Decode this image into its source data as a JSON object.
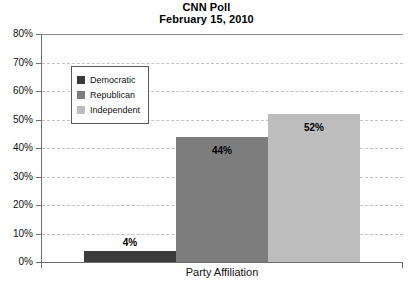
{
  "chart_data": {
    "type": "bar",
    "title": "CNN Poll",
    "subtitle": "February 15, 2010",
    "xlabel": "Party Affiliation",
    "ylabel": "",
    "categories": [
      "Democratic",
      "Republican",
      "Independent"
    ],
    "values": [
      4,
      44,
      52
    ],
    "value_labels": [
      "4%",
      "44%",
      "52%"
    ],
    "ylim": [
      0,
      80
    ],
    "y_ticks": [
      0,
      10,
      20,
      30,
      40,
      50,
      60,
      70,
      80
    ],
    "y_tick_labels": [
      "0%",
      "10%",
      "20%",
      "30%",
      "40%",
      "50%",
      "60%",
      "70%",
      "80%"
    ],
    "grid": true,
    "legend_position": "upper-left-inside",
    "series_colors": [
      "#3b3b3b",
      "#7d7d7d",
      "#bdbdbd"
    ]
  },
  "legend": {
    "items": [
      {
        "label": "Democratic",
        "color": "#3b3b3b"
      },
      {
        "label": "Republican",
        "color": "#7d7d7d"
      },
      {
        "label": "Independent",
        "color": "#bdbdbd"
      }
    ]
  },
  "colors": {
    "democratic": "#3b3b3b",
    "republican": "#7d7d7d",
    "independent": "#bdbdbd",
    "axis": "#6e6e6e",
    "grid": "#c3c3c3",
    "background": "#ffffff"
  }
}
